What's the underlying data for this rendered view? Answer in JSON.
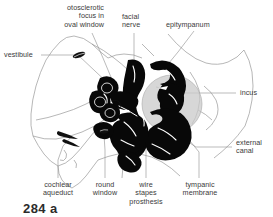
{
  "figure": {
    "kind": "anatomical-illustration",
    "figure_number": "284 a",
    "background_color": "#ffffff",
    "ink_color": "#000000",
    "outline_color": "#8d8d8d",
    "label_color": "#3a3a3a",
    "membrane_color": "#c9c9c9"
  },
  "labels": {
    "otosclerotic_focus": "otosclerotic\nfocus in\noval window",
    "facial_nerve": "facial\nnerve",
    "epitympanum": "epitympanum",
    "vestibule": "vestibule",
    "incus": "incus",
    "external_canal": "external\ncanal",
    "cochlear_aqueduct": "cochlear\naqueduct",
    "round_window": "round\nwindow",
    "wire_stapes_prosthesis": "wire\nstapes\nprosthesis",
    "tympanic_membrane": "tympanic\nmembrane"
  }
}
